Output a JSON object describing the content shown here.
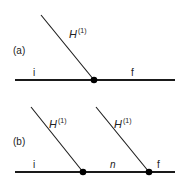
{
  "panels": [
    {
      "label": "(a)",
      "interaction_label": "H",
      "interaction_sup": "(1)",
      "initial": "i",
      "final": "f"
    },
    {
      "label": "(b)",
      "interaction_label_1": "H",
      "interaction_sup_1": "(1)",
      "interaction_label_2": "H",
      "interaction_sup_2": "(1)",
      "initial": "i",
      "intermediate": "n",
      "final": "f"
    }
  ],
  "colors": {
    "line": "#1a1a1a",
    "vertex": "#000000"
  }
}
